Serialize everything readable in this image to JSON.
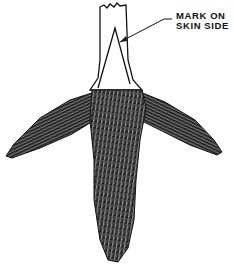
{
  "figure": {
    "annotation": {
      "line1": "MARK ON",
      "line2": "SKIN SIDE"
    },
    "colors": {
      "ink": "#111111",
      "background": "#ffffff"
    }
  }
}
